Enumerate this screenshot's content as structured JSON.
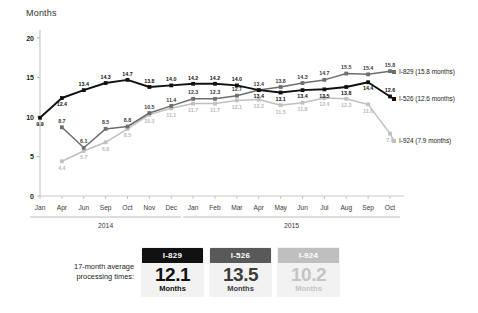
{
  "chart_data": {
    "type": "line",
    "title": "",
    "ylabel": "Months",
    "xlabel": "",
    "ylim": [
      0,
      20
    ],
    "yticks": [
      0,
      5,
      10,
      15,
      20
    ],
    "grid": false,
    "legend_position": "right",
    "categories": [
      "Jan",
      "Apr",
      "Jun",
      "Sep",
      "Oct",
      "Nov",
      "Dec",
      "Jan",
      "Feb",
      "Mar",
      "Apr",
      "May",
      "Jun",
      "Jul",
      "Aug",
      "Sep",
      "Oct"
    ],
    "period_groups": [
      {
        "label": "2014",
        "start_index": 0,
        "end_index": 6
      },
      {
        "label": "2015",
        "start_index": 7,
        "end_index": 16
      }
    ],
    "series": [
      {
        "name": "I-526",
        "legend": "I-526 (12.6 months)",
        "color": "#111111",
        "values": [
          9.9,
          12.4,
          13.4,
          14.3,
          14.7,
          13.8,
          14.0,
          14.2,
          14.2,
          14.0,
          13.4,
          13.1,
          13.4,
          13.5,
          13.8,
          14.4,
          12.6
        ]
      },
      {
        "name": "I-829",
        "legend": "I-829 (15.8 months)",
        "color": "#6e6e6e",
        "values": [
          null,
          8.7,
          6.1,
          8.5,
          8.8,
          10.5,
          11.4,
          12.3,
          12.3,
          12.7,
          13.4,
          13.8,
          14.3,
          14.7,
          15.5,
          15.4,
          15.8
        ]
      },
      {
        "name": "I-924",
        "legend": "I-924 (7.9 months)",
        "color": "#c0c0c0",
        "values": [
          null,
          4.4,
          5.7,
          6.8,
          8.5,
          10.3,
          11.1,
          11.7,
          11.7,
          12.1,
          12.2,
          11.5,
          11.8,
          12.4,
          12.3,
          11.6,
          7.9
        ]
      }
    ]
  },
  "summary": {
    "label": "17-month average\nprocessing times:",
    "label_line1": "17-month average",
    "label_line2": "processing times:",
    "cards": [
      {
        "title": "I-829",
        "value": "12.1",
        "unit": "Months"
      },
      {
        "title": "I-526",
        "value": "13.5",
        "unit": "Months"
      },
      {
        "title": "I-924",
        "value": "10.2",
        "unit": "Months"
      }
    ]
  }
}
